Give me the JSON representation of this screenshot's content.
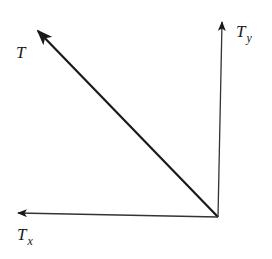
{
  "diagram": {
    "vectors": [
      {
        "id": "T",
        "label": "T",
        "subscript": "",
        "from": [
          218,
          217
        ],
        "to": [
          36,
          29
        ]
      },
      {
        "id": "Ty",
        "label": "T",
        "subscript": "y",
        "from": [
          218,
          217
        ],
        "to": [
          222,
          22
        ]
      },
      {
        "id": "Tx",
        "label": "T",
        "subscript": "x",
        "from": [
          218,
          217
        ],
        "to": [
          18,
          213
        ]
      }
    ],
    "labels": {
      "T": {
        "main": "T",
        "sub": ""
      },
      "Ty": {
        "main": "T",
        "sub": "y"
      },
      "Tx": {
        "main": "T",
        "sub": "x"
      }
    },
    "colors": {
      "stroke": "#1a1a1a",
      "background": "#ffffff"
    }
  }
}
